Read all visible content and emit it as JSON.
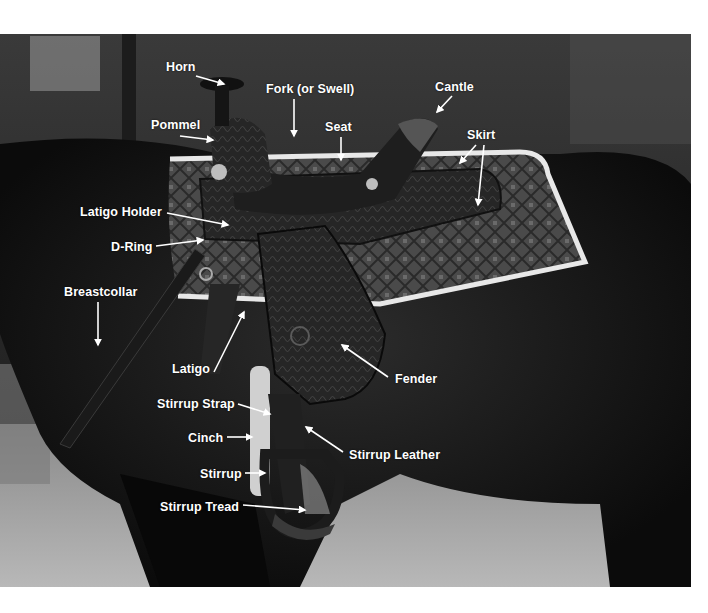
{
  "figure": {
    "style": "black-and-white photograph with white callout labels and arrows",
    "background_color": "#ffffff",
    "label_color": "#ffffff",
    "photo_bounds": {
      "x": 0,
      "y": 34,
      "width": 691,
      "height": 553
    }
  },
  "labels": [
    {
      "id": "horn",
      "text": "Horn",
      "x": 166,
      "y": 60,
      "arrow": [
        [
          196,
          76
        ],
        [
          224,
          84
        ]
      ]
    },
    {
      "id": "fork",
      "text": "Fork (or Swell)",
      "x": 266,
      "y": 82,
      "arrow": [
        [
          294,
          99
        ],
        [
          294,
          136
        ]
      ]
    },
    {
      "id": "cantle",
      "text": "Cantle",
      "x": 435,
      "y": 80,
      "arrow": [
        [
          452,
          96
        ],
        [
          437,
          112
        ]
      ]
    },
    {
      "id": "pommel",
      "text": "Pommel",
      "x": 151,
      "y": 118,
      "arrow": [
        [
          180,
          136
        ],
        [
          213,
          140
        ]
      ]
    },
    {
      "id": "seat",
      "text": "Seat",
      "x": 325,
      "y": 120,
      "arrow": [
        [
          341,
          137
        ],
        [
          341,
          160
        ]
      ]
    },
    {
      "id": "skirt",
      "text": "Skirt",
      "x": 467,
      "y": 128,
      "arrow_a": [
        [
          476,
          145
        ],
        [
          460,
          163
        ]
      ],
      "arrow_b": [
        [
          484,
          145
        ],
        [
          478,
          205
        ]
      ]
    },
    {
      "id": "latigo-holder",
      "text": "Latigo Holder",
      "x": 80,
      "y": 205,
      "arrow": [
        [
          167,
          213
        ],
        [
          228,
          225
        ]
      ]
    },
    {
      "id": "d-ring",
      "text": "D-Ring",
      "x": 111,
      "y": 240,
      "arrow": [
        [
          156,
          246
        ],
        [
          203,
          240
        ]
      ]
    },
    {
      "id": "breastcollar",
      "text": "Breastcollar",
      "x": 64,
      "y": 285,
      "arrow": [
        [
          98,
          302
        ],
        [
          98,
          345
        ]
      ]
    },
    {
      "id": "latigo",
      "text": "Latigo",
      "x": 172,
      "y": 362,
      "arrow": [
        [
          214,
          372
        ],
        [
          244,
          312
        ]
      ]
    },
    {
      "id": "fender",
      "text": "Fender",
      "x": 395,
      "y": 372,
      "arrow": [
        [
          388,
          377
        ],
        [
          342,
          345
        ]
      ]
    },
    {
      "id": "stirrup-strap",
      "text": "Stirrup Strap",
      "x": 157,
      "y": 397,
      "arrow": [
        [
          238,
          404
        ],
        [
          270,
          414
        ]
      ]
    },
    {
      "id": "cinch",
      "text": "Cinch",
      "x": 188,
      "y": 431,
      "arrow": [
        [
          227,
          437
        ],
        [
          252,
          437
        ]
      ]
    },
    {
      "id": "stirrup-leather",
      "text": "Stirrup Leather",
      "x": 349,
      "y": 448,
      "arrow": [
        [
          343,
          452
        ],
        [
          306,
          427
        ]
      ]
    },
    {
      "id": "stirrup",
      "text": "Stirrup",
      "x": 200,
      "y": 467,
      "arrow": [
        [
          245,
          473
        ],
        [
          265,
          473
        ]
      ]
    },
    {
      "id": "stirrup-tread",
      "text": "Stirrup Tread",
      "x": 160,
      "y": 500,
      "arrow": [
        [
          243,
          505
        ],
        [
          305,
          510
        ]
      ]
    }
  ]
}
